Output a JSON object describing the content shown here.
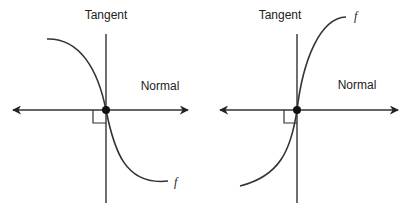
{
  "colors": {
    "stroke": "#333333",
    "text": "#222222",
    "background": "#ffffff"
  },
  "diagrams": [
    {
      "id": "left",
      "tangent_label": "Tangent",
      "normal_label": "Normal",
      "function_label": "f",
      "curve_direction": "decreasing"
    },
    {
      "id": "right",
      "tangent_label": "Tangent",
      "normal_label": "Normal",
      "function_label": "f",
      "curve_direction": "increasing"
    }
  ]
}
